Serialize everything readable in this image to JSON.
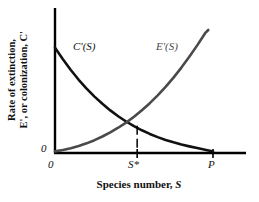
{
  "chart_data": {
    "type": "line",
    "title": "",
    "xlabel": "Species number, S",
    "ylabel_line1": "Rate of extinction,",
    "ylabel_line2": "E', or colonization, C'",
    "xlim": [
      0,
      1
    ],
    "ylim": [
      0,
      1
    ],
    "grid": false,
    "legend": "inline-curve-labels",
    "xticks": [
      "0",
      "S*",
      "P"
    ],
    "xtick_positions": [
      0.0,
      0.52,
      1.0
    ],
    "yticks": [
      "0"
    ],
    "ytick_positions": [
      0.0
    ],
    "annotations": [
      {
        "name": "equilibrium-dropline",
        "text": "",
        "x": 0.52,
        "y": 0.215,
        "style": "dashed vertical line from intersection to x-axis"
      }
    ],
    "series": [
      {
        "name": "C'(S)",
        "label": "C'(S)",
        "color": "#111111",
        "description": "Colonization rate, decreasing convex curve from high value at S=0 to zero at S=P",
        "x": [
          0.0,
          0.05,
          0.1,
          0.15,
          0.2,
          0.25,
          0.3,
          0.35,
          0.4,
          0.45,
          0.5,
          0.55,
          0.6,
          0.65,
          0.7,
          0.75,
          0.8,
          0.85,
          0.9,
          0.95,
          1.0
        ],
        "y": [
          0.855,
          0.76,
          0.672,
          0.592,
          0.52,
          0.454,
          0.395,
          0.341,
          0.293,
          0.25,
          0.212,
          0.178,
          0.148,
          0.122,
          0.099,
          0.079,
          0.061,
          0.046,
          0.032,
          0.018,
          0.004
        ]
      },
      {
        "name": "E'(S)",
        "label": "E'(S)",
        "color": "#4a4a4a",
        "description": "Extinction rate, increasing convex curve from zero at S=0 rising steeply toward S=P",
        "x": [
          0.0,
          0.05,
          0.1,
          0.15,
          0.2,
          0.25,
          0.3,
          0.35,
          0.4,
          0.45,
          0.5,
          0.55,
          0.6,
          0.65,
          0.7,
          0.75,
          0.8,
          0.85,
          0.9,
          0.95,
          0.97
        ],
        "y": [
          0.005,
          0.016,
          0.031,
          0.049,
          0.071,
          0.097,
          0.127,
          0.161,
          0.199,
          0.241,
          0.289,
          0.342,
          0.4,
          0.464,
          0.534,
          0.61,
          0.692,
          0.78,
          0.874,
          0.974,
          1.0
        ]
      }
    ]
  },
  "axis": {
    "y_label_line1": "Rate of extinction,",
    "y_label_line2": "E', or colonization, C'",
    "x_label": "Species number, S",
    "x_tick_0": "0",
    "x_tick_sstar": "S*",
    "x_tick_p": "P",
    "y_tick_0": "0"
  },
  "curve_labels": {
    "colonization": "C'(S)",
    "extinction": "E'(S)"
  },
  "colors": {
    "colonization_curve": "#111111",
    "extinction_curve": "#4a4a4a",
    "axis": "#000000",
    "background": "#ffffff"
  }
}
